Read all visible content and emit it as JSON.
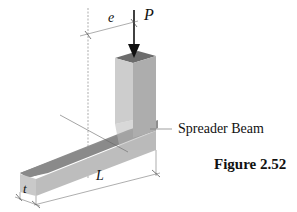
{
  "figure": {
    "caption": "Figure 2.52",
    "component_label": "Spreader Beam",
    "labels": {
      "eccentricity": "e",
      "load": "P",
      "length": "L",
      "thickness": "t"
    }
  },
  "colors": {
    "face_top": "#8a8a8a",
    "face_front": "#c4c4c4",
    "face_side": "#a9a9a9",
    "post_top": "#6e6e6e",
    "post_front": "#cfcfcf",
    "post_side": "#b0b0b0",
    "lines": "#555555",
    "text": "#111111"
  }
}
